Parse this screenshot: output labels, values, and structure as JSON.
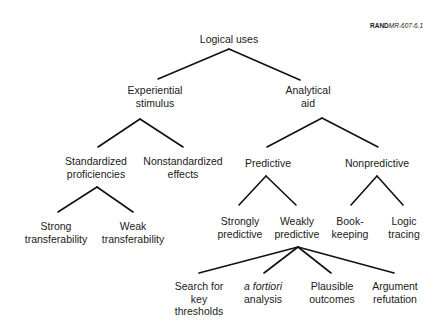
{
  "figure_ref": {
    "prefix": "RAND",
    "id": "MR-607-6.1"
  },
  "tree": {
    "root": {
      "lines": [
        "Logical uses"
      ]
    },
    "experiential": {
      "lines": [
        "Experiential",
        "stimulus"
      ]
    },
    "analytical": {
      "lines": [
        "Analytical",
        "aid"
      ]
    },
    "standardized": {
      "lines": [
        "Standardized",
        "proficiencies"
      ]
    },
    "nonstandardized": {
      "lines": [
        "Nonstandardized",
        "effects"
      ]
    },
    "predictive": {
      "lines": [
        "Predictive"
      ]
    },
    "nonpredictive": {
      "lines": [
        "Nonpredictive"
      ]
    },
    "strong_transfer": {
      "lines": [
        "Strong",
        "transferability"
      ]
    },
    "weak_transfer": {
      "lines": [
        "Weak",
        "transferability"
      ]
    },
    "strongly_predictive": {
      "lines": [
        "Strongly",
        "predictive"
      ]
    },
    "weakly_predictive": {
      "lines": [
        "Weakly",
        "predictive"
      ]
    },
    "bookkeeping": {
      "lines": [
        "Book-",
        "keeping"
      ]
    },
    "logic_tracing": {
      "lines": [
        "Logic",
        "tracing"
      ]
    },
    "search_thresholds": {
      "lines": [
        "Search for",
        "key",
        "thresholds"
      ]
    },
    "a_fortiori": {
      "lines": [
        "a fortiori",
        "analysis"
      ]
    },
    "plausible_outcomes": {
      "lines": [
        "Plausible",
        "outcomes"
      ]
    },
    "argument_refutation": {
      "lines": [
        "Argument",
        "refutation"
      ]
    }
  },
  "edges": [
    [
      "root",
      "experiential"
    ],
    [
      "root",
      "analytical"
    ],
    [
      "experiential",
      "standardized"
    ],
    [
      "experiential",
      "nonstandardized"
    ],
    [
      "analytical",
      "predictive"
    ],
    [
      "analytical",
      "nonpredictive"
    ],
    [
      "standardized",
      "strong_transfer"
    ],
    [
      "standardized",
      "weak_transfer"
    ],
    [
      "predictive",
      "strongly_predictive"
    ],
    [
      "predictive",
      "weakly_predictive"
    ],
    [
      "nonpredictive",
      "bookkeeping"
    ],
    [
      "nonpredictive",
      "logic_tracing"
    ],
    [
      "weakly_predictive",
      "search_thresholds"
    ],
    [
      "weakly_predictive",
      "a_fortiori"
    ],
    [
      "weakly_predictive",
      "plausible_outcomes"
    ],
    [
      "weakly_predictive",
      "argument_refutation"
    ]
  ]
}
